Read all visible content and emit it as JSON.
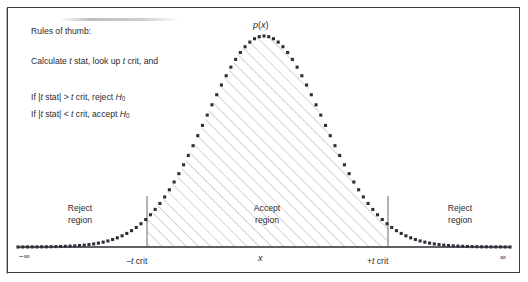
{
  "figure": {
    "curve_label": "p(x)",
    "axis_label": "x",
    "left_bound": "−∞",
    "right_bound": "∞",
    "crit_left": "−t crit",
    "crit_right": "+t crit",
    "crit_left_sign": "−",
    "crit_right_sign": "+",
    "crit_var": "t",
    "crit_word": "crit"
  },
  "regions": [
    {
      "name": "reject-left",
      "line1": "Reject",
      "line2": "region"
    },
    {
      "name": "accept",
      "line1": "Accept",
      "line2": "region"
    },
    {
      "name": "reject-right",
      "line1": "Reject",
      "line2": "region"
    }
  ],
  "rules": {
    "heading": "Rules of thumb:",
    "line_calc_pre": "Calculate ",
    "line_calc_var1": "t",
    "line_calc_mid": " stat, look up ",
    "line_calc_var2": "t",
    "line_calc_post": " crit, and",
    "line_reject_pre": "If |",
    "line_reject_var1": "t",
    "line_reject_mid": " stat| > ",
    "line_reject_var2": "t",
    "line_reject_post": " crit, reject ",
    "line_reject_h": "H",
    "line_reject_sub": "0",
    "line_accept_pre": "If |",
    "line_accept_var1": "t",
    "line_accept_mid": " stat| < ",
    "line_accept_var2": "t",
    "line_accept_post": " crit, accept ",
    "line_accept_h": "H",
    "line_accept_sub": "0"
  },
  "chart_data": {
    "type": "line",
    "title": "",
    "xlabel": "x",
    "ylabel": "p(x)",
    "distribution": "normal",
    "mean": 0,
    "sigma": 1,
    "xlim": [
      -4.2,
      4.2
    ],
    "ylim": [
      0,
      1
    ],
    "grid": false,
    "legend": "none",
    "marker": "filled-square",
    "shaded_region": {
      "from": -1.95,
      "to": 1.95,
      "fill": "diagonal-hatch"
    },
    "vlines": [
      {
        "x": -1.95,
        "label": "−t crit"
      },
      {
        "x": 1.95,
        "label": "+t crit"
      }
    ],
    "annotations": [
      {
        "text": "p(x)",
        "x": 0,
        "y": 1.02
      },
      {
        "text": "Accept region",
        "x": 0,
        "y": 0.13
      },
      {
        "text": "Reject region",
        "x": -3.05,
        "y": 0.13
      },
      {
        "text": "Reject region",
        "x": 3.05,
        "y": 0.13
      }
    ],
    "x": [
      -4.2,
      -4.0,
      -3.8,
      -3.6,
      -3.4,
      -3.2,
      -3.0,
      -2.8,
      -2.6,
      -2.4,
      -2.2,
      -2.0,
      -1.8,
      -1.6,
      -1.4,
      -1.2,
      -1.0,
      -0.8,
      -0.6,
      -0.4,
      -0.2,
      0.0,
      0.2,
      0.4,
      0.6,
      0.8,
      1.0,
      1.2,
      1.4,
      1.6,
      1.8,
      2.0,
      2.2,
      2.4,
      2.6,
      2.8,
      3.0,
      3.2,
      3.4,
      3.6,
      3.8,
      4.0,
      4.2
    ],
    "y": [
      0.0,
      0.0,
      0.001,
      0.002,
      0.003,
      0.006,
      0.011,
      0.02,
      0.034,
      0.056,
      0.089,
      0.135,
      0.198,
      0.278,
      0.375,
      0.487,
      0.607,
      0.726,
      0.835,
      0.923,
      0.98,
      1.0,
      0.98,
      0.923,
      0.835,
      0.726,
      0.607,
      0.487,
      0.375,
      0.278,
      0.198,
      0.135,
      0.089,
      0.056,
      0.034,
      0.02,
      0.011,
      0.006,
      0.003,
      0.002,
      0.001,
      0.0,
      0.0
    ]
  },
  "colors": {
    "frame": "#3a3a42",
    "curve": "#2f2f38",
    "hatch": "#9a9aa2",
    "axis": "#2a2a30",
    "text": "#2a2a30"
  }
}
